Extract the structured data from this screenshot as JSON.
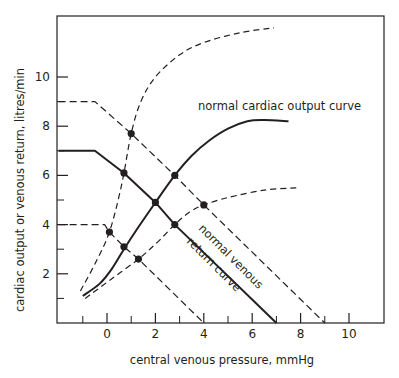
{
  "chart_data": {
    "type": "line",
    "title": "",
    "xlabel": "central venous pressure, mmHg",
    "ylabel": "cardiac output or venous return, litres/min",
    "xlim": [
      -2,
      11.2
    ],
    "ylim": [
      0,
      12.5
    ],
    "x_ticks": [
      0,
      2,
      4,
      6,
      8,
      10
    ],
    "x_minor_ticks": [
      -1,
      1,
      3,
      5,
      7,
      9
    ],
    "y_ticks": [
      2,
      4,
      6,
      8,
      10
    ],
    "y_minor_ticks": [
      1,
      3,
      5,
      7,
      9
    ],
    "grid": false,
    "legend": "none (inline annotations)",
    "annotations": [
      {
        "text": "normal cardiac output curve",
        "x": 3.8,
        "y": 9.0
      },
      {
        "text": "normal venous",
        "x": 3.6,
        "y": 3.8,
        "rotation": 45
      },
      {
        "text": "return curve",
        "x": 3.2,
        "y": 3.0,
        "rotation": 45
      }
    ],
    "series": [
      {
        "name": "normal cardiac output curve",
        "style": "solid",
        "width": 2,
        "points": [
          [
            -1.0,
            1.1
          ],
          [
            -0.3,
            1.6
          ],
          [
            0.2,
            2.2
          ],
          [
            0.7,
            3.0
          ],
          [
            1.3,
            3.9
          ],
          [
            2.0,
            4.9
          ],
          [
            2.8,
            6.0
          ],
          [
            3.5,
            6.8
          ],
          [
            4.2,
            7.4
          ],
          [
            5.0,
            7.9
          ],
          [
            5.8,
            8.2
          ],
          [
            6.5,
            8.25
          ],
          [
            7.5,
            8.2
          ]
        ]
      },
      {
        "name": "increased cardiac output curve",
        "style": "dashed",
        "width": 1.2,
        "points": [
          [
            -1.1,
            1.3
          ],
          [
            -0.5,
            2.4
          ],
          [
            0.1,
            3.7
          ],
          [
            0.6,
            5.6
          ],
          [
            1.0,
            7.7
          ],
          [
            1.4,
            9.0
          ],
          [
            2.0,
            10.0
          ],
          [
            3.0,
            10.9
          ],
          [
            4.0,
            11.4
          ],
          [
            5.5,
            11.8
          ],
          [
            6.9,
            12.0
          ]
        ]
      },
      {
        "name": "decreased cardiac output curve",
        "style": "dashed",
        "width": 1.2,
        "points": [
          [
            -0.9,
            1.0
          ],
          [
            0.2,
            1.8
          ],
          [
            1.3,
            2.6
          ],
          [
            2.1,
            3.3
          ],
          [
            2.8,
            4.0
          ],
          [
            3.4,
            4.5
          ],
          [
            4.0,
            4.8
          ],
          [
            5.0,
            5.1
          ],
          [
            6.5,
            5.4
          ],
          [
            7.9,
            5.5
          ]
        ]
      },
      {
        "name": "normal venous return curve",
        "style": "solid",
        "width": 2,
        "points": [
          [
            -2.0,
            7.0
          ],
          [
            -0.5,
            7.0
          ],
          [
            0.7,
            6.1
          ],
          [
            2.0,
            4.9
          ],
          [
            2.8,
            4.0
          ],
          [
            7.0,
            0.0
          ]
        ]
      },
      {
        "name": "increased venous return curve",
        "style": "dashed",
        "width": 1.2,
        "points": [
          [
            -2.0,
            9.0
          ],
          [
            -0.5,
            9.0
          ],
          [
            1.0,
            7.7
          ],
          [
            2.8,
            6.0
          ],
          [
            4.0,
            4.8
          ],
          [
            9.0,
            0.0
          ]
        ]
      },
      {
        "name": "decreased venous return curve",
        "style": "dashed",
        "width": 1.2,
        "points": [
          [
            -2.0,
            4.0
          ],
          [
            -0.1,
            4.0
          ],
          [
            0.1,
            3.7
          ],
          [
            0.7,
            3.1
          ],
          [
            1.3,
            2.6
          ],
          [
            4.0,
            0.0
          ]
        ]
      }
    ],
    "intersection_points": [
      [
        1.0,
        7.7
      ],
      [
        0.7,
        6.1
      ],
      [
        2.8,
        6.0
      ],
      [
        2.0,
        4.9
      ],
      [
        0.1,
        3.7
      ],
      [
        2.8,
        4.0
      ],
      [
        0.7,
        3.1
      ],
      [
        4.0,
        4.8
      ],
      [
        1.3,
        2.6
      ]
    ]
  },
  "colors": {
    "ink": "#231f20",
    "background": "#ffffff"
  }
}
